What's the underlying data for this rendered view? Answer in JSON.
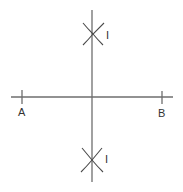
{
  "diagram": {
    "type": "perpendicular-bisector-construction",
    "segment": {
      "start_label": "A",
      "end_label": "B"
    },
    "arc_intersections": [
      {
        "position": "top",
        "label": "I"
      },
      {
        "position": "bottom",
        "label": "I"
      }
    ],
    "colors": {
      "line": "#6e6e6e",
      "arc": "#4a4a4a",
      "text": "#333333",
      "background": "#ffffff"
    }
  }
}
